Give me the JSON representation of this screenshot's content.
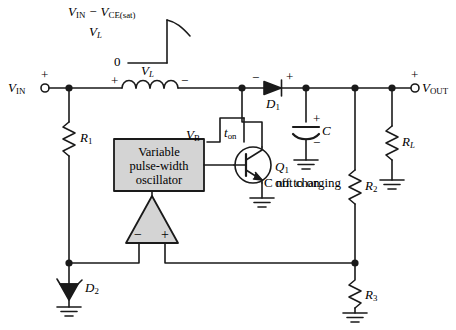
{
  "figure": {
    "colors": {
      "line": "#1a1a1a",
      "block_fill": "#d4d4d4",
      "background": "#ffffff"
    }
  },
  "waveform": {
    "top_level_label": "V",
    "top_level_sub": "IN",
    "top_level_rest": " − V",
    "top_level_sub2": "CE(sat)",
    "axis_label": "V",
    "axis_label_sub": "L",
    "zero_label": "0"
  },
  "terminals": {
    "input": {
      "label": "V",
      "sub": "IN",
      "polarity": "+"
    },
    "output": {
      "label": "V",
      "sub": "OUT",
      "polarity": "+"
    }
  },
  "components": {
    "inductor": {
      "label": "V",
      "sub": "L",
      "plus": "+",
      "minus": "−"
    },
    "diode_d1": {
      "label": "D",
      "sub": "1",
      "minus": "−",
      "plus": "+"
    },
    "capacitor_c": {
      "label": "C",
      "plus": "+",
      "minus": "−"
    },
    "resistor_r1": {
      "label": "R",
      "sub": "1"
    },
    "resistor_r2": {
      "label": "R",
      "sub": "2"
    },
    "resistor_r3": {
      "label": "R",
      "sub": "3"
    },
    "resistor_rl": {
      "label": "R",
      "sub": "L"
    },
    "zener_d2": {
      "label": "D",
      "sub": "2"
    },
    "transistor_q1": {
      "label": "Q",
      "sub": "1",
      "state": "off to on"
    },
    "comparator": {
      "minus": "−",
      "plus": "+"
    },
    "oscillator": {
      "line1": "Variable",
      "line2": "pulse-width",
      "line3": "oscillator"
    }
  },
  "annotations": {
    "base_voltage": {
      "label": "V",
      "sub": "B"
    },
    "t_on": {
      "label": "t",
      "sub": "on"
    },
    "cap_note": "C not charging"
  }
}
